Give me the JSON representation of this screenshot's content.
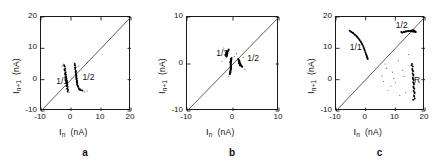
{
  "figure": {
    "caption_letters": [
      "a",
      "b",
      "c"
    ],
    "axis_unit": "(nA)",
    "x_axis_symbol": "I",
    "x_axis_sub": "n",
    "y_axis_symbol": "I",
    "y_axis_sub": "n+1"
  },
  "chart_data": [
    {
      "type": "scatter",
      "panel": "a",
      "title": "",
      "xlabel": "I_n (nA)",
      "ylabel": "I_n+1 (nA)",
      "xlim": [
        -10,
        20
      ],
      "ylim": [
        -10,
        20
      ],
      "xticks": [
        -10,
        0,
        10,
        20
      ],
      "yticks": [
        -10,
        0,
        10,
        20
      ],
      "xticklabels": [
        "-10",
        "0",
        "10",
        "20"
      ],
      "yticklabels": [
        "-10",
        "0",
        "10",
        "20"
      ],
      "grid": false,
      "legend": "none",
      "identity_line": {
        "from": [
          -10,
          -10
        ],
        "to": [
          20,
          20
        ],
        "label": "y = x"
      },
      "annotations": [
        {
          "text": "1/1",
          "x": -4.6,
          "y": -0.6
        },
        {
          "text": "1/2",
          "x": 4.2,
          "y": 0.6
        }
      ],
      "series": [
        {
          "name": "1/1",
          "marker": "dot",
          "points": [
            [
              -2.1,
              4.2
            ],
            [
              -1.9,
              3.5
            ],
            [
              -2.0,
              2.9
            ],
            [
              -1.8,
              2.4
            ],
            [
              -1.9,
              2.0
            ],
            [
              -1.7,
              1.6
            ],
            [
              -1.8,
              1.2
            ],
            [
              -1.6,
              0.9
            ],
            [
              -1.7,
              0.6
            ],
            [
              -1.5,
              0.3
            ],
            [
              -1.6,
              0.0
            ],
            [
              -1.4,
              -0.3
            ],
            [
              -1.5,
              -0.6
            ],
            [
              -1.3,
              -0.9
            ],
            [
              -1.4,
              -1.2
            ],
            [
              -1.2,
              -1.5
            ],
            [
              -1.3,
              -1.9
            ],
            [
              -1.1,
              -2.3
            ],
            [
              -1.2,
              -2.8
            ],
            [
              -1.0,
              -3.3
            ],
            [
              -2.2,
              3.2
            ],
            [
              -2.0,
              1.8
            ],
            [
              -1.9,
              0.7
            ],
            [
              -1.8,
              -0.2
            ],
            [
              -1.6,
              -1.1
            ],
            [
              -1.5,
              -2.0
            ],
            [
              -1.3,
              -2.9
            ],
            [
              -2.3,
              4.6
            ],
            [
              -1.1,
              -3.8
            ],
            [
              -1.45,
              -0.45
            ]
          ]
        },
        {
          "name": "1/2",
          "marker": "dot",
          "points": [
            [
              1.3,
              4.6
            ],
            [
              1.5,
              4.0
            ],
            [
              1.4,
              3.4
            ],
            [
              1.6,
              2.9
            ],
            [
              1.5,
              2.4
            ],
            [
              1.7,
              2.0
            ],
            [
              1.6,
              1.6
            ],
            [
              1.8,
              1.2
            ],
            [
              1.7,
              0.8
            ],
            [
              1.9,
              0.5
            ],
            [
              1.8,
              0.1
            ],
            [
              2.0,
              -0.3
            ],
            [
              1.9,
              -0.7
            ],
            [
              2.1,
              -1.1
            ],
            [
              2.0,
              -1.5
            ],
            [
              2.2,
              -1.9
            ],
            [
              2.4,
              -2.3
            ],
            [
              2.6,
              -2.7
            ],
            [
              2.9,
              -3.0
            ],
            [
              3.3,
              -3.3
            ],
            [
              1.4,
              3.8
            ],
            [
              1.6,
              2.6
            ],
            [
              1.75,
              1.4
            ],
            [
              1.85,
              0.3
            ],
            [
              2.05,
              -0.9
            ],
            [
              2.3,
              -2.1
            ],
            [
              2.8,
              -3.2
            ],
            [
              1.25,
              5.0
            ],
            [
              3.8,
              -3.5
            ],
            [
              1.95,
              -0.5
            ]
          ]
        },
        {
          "name": "scatter-noise",
          "marker": "dot",
          "points": [
            [
              1.0,
              5.4
            ],
            [
              -2.6,
              5.0
            ],
            [
              4.6,
              -3.9
            ],
            [
              -0.6,
              -4.1
            ],
            [
              5.4,
              -3.6
            ],
            [
              -3.0,
              4.4
            ],
            [
              2.6,
              4.4
            ]
          ]
        }
      ]
    },
    {
      "type": "scatter",
      "panel": "b",
      "title": "",
      "xlabel": "I_n (nA)",
      "ylabel": "I_n+1 (nA)",
      "xlim": [
        -10,
        10
      ],
      "ylim": [
        -10,
        10
      ],
      "xticks": [
        -10,
        0,
        10
      ],
      "yticks": [
        -10,
        0,
        10
      ],
      "xticklabels": [
        "-10",
        "0",
        "10"
      ],
      "yticklabels": [
        "-10",
        "0",
        "10"
      ],
      "grid": false,
      "legend": "none",
      "identity_line": {
        "from": [
          -10,
          -10
        ],
        "to": [
          10,
          10
        ],
        "label": "y = x"
      },
      "annotations": [
        {
          "text": "1/3",
          "x": -3.4,
          "y": 2.1
        },
        {
          "text": "1/2",
          "x": 3.3,
          "y": 1.0
        }
      ],
      "series": [
        {
          "name": "1/3",
          "marker": "dot",
          "points": [
            [
              -1.4,
              2.6
            ],
            [
              -1.3,
              2.4
            ],
            [
              -1.45,
              2.2
            ],
            [
              -1.35,
              2.0
            ],
            [
              -1.5,
              1.8
            ],
            [
              -1.4,
              1.6
            ],
            [
              -1.25,
              2.5
            ],
            [
              -1.55,
              2.1
            ],
            [
              -1.3,
              1.9
            ],
            [
              -1.45,
              1.7
            ],
            [
              -1.2,
              2.3
            ],
            [
              -1.5,
              2.45
            ],
            [
              -1.35,
              1.75
            ],
            [
              -1.25,
              2.05
            ],
            [
              -1.6,
              1.95
            ],
            [
              -1.1,
              2.7
            ],
            [
              -1.0,
              2.9
            ],
            [
              -0.95,
              3.1
            ]
          ]
        },
        {
          "name": "1/2-upper",
          "marker": "dot",
          "points": [
            [
              1.2,
              0.9
            ],
            [
              1.35,
              0.75
            ],
            [
              1.25,
              0.6
            ],
            [
              1.4,
              0.5
            ],
            [
              1.3,
              0.35
            ],
            [
              1.5,
              0.25
            ],
            [
              1.45,
              0.1
            ],
            [
              1.6,
              0.0
            ],
            [
              1.55,
              -0.15
            ],
            [
              1.7,
              -0.25
            ],
            [
              1.15,
              1.05
            ],
            [
              1.3,
              0.15
            ],
            [
              1.5,
              -0.3
            ],
            [
              1.62,
              -0.1
            ],
            [
              1.38,
              0.65
            ],
            [
              1.8,
              -0.4
            ],
            [
              1.9,
              -0.5
            ],
            [
              2.0,
              -0.6
            ]
          ]
        },
        {
          "name": "central-column",
          "marker": "dot",
          "points": [
            [
              -0.5,
              1.1
            ],
            [
              -0.45,
              0.8
            ],
            [
              -0.55,
              0.5
            ],
            [
              -0.4,
              0.25
            ],
            [
              -0.5,
              0.0
            ],
            [
              -0.45,
              -0.25
            ],
            [
              -0.55,
              -0.5
            ],
            [
              -0.4,
              -0.75
            ],
            [
              -0.5,
              -1.0
            ],
            [
              -0.45,
              -1.25
            ],
            [
              -0.6,
              -1.5
            ],
            [
              -0.55,
              -1.75
            ],
            [
              -0.65,
              -2.0
            ],
            [
              -0.35,
              0.95
            ],
            [
              -0.6,
              0.35
            ],
            [
              -0.42,
              -0.4
            ],
            [
              -0.52,
              -1.15
            ],
            [
              -0.62,
              -1.85
            ],
            [
              -0.3,
              1.3
            ],
            [
              -0.7,
              -2.2
            ],
            [
              -0.48,
              -0.9
            ],
            [
              -0.58,
              -1.6
            ],
            [
              -0.38,
              0.6
            ],
            [
              -0.52,
              -0.05
            ]
          ]
        },
        {
          "name": "scatter-noise",
          "marker": "dot",
          "points": [
            [
              -2.0,
              3.4
            ],
            [
              0.3,
              1.6
            ],
            [
              2.6,
              -1.2
            ],
            [
              -1.0,
              -2.6
            ],
            [
              0.8,
              2.2
            ],
            [
              -2.4,
              0.6
            ],
            [
              2.2,
              1.4
            ]
          ]
        }
      ]
    },
    {
      "type": "scatter",
      "panel": "c",
      "title": "",
      "xlabel": "I_n (nA)",
      "ylabel": "I_n+1 (nA)",
      "xlim": [
        -10,
        20
      ],
      "ylim": [
        -10,
        20
      ],
      "xticks": [
        -10,
        0,
        10,
        20
      ],
      "yticks": [
        -10,
        0,
        10,
        20
      ],
      "xticklabels": [
        "-10",
        "0",
        "10",
        "20"
      ],
      "yticklabels": [
        "-10",
        "0",
        "10",
        "20"
      ],
      "grid": false,
      "legend": "none",
      "identity_line": {
        "from": [
          -10,
          -10
        ],
        "to": [
          20,
          20
        ],
        "label": "y = x"
      },
      "annotations": [
        {
          "text": "1/1",
          "x": -5.0,
          "y": 10.2
        },
        {
          "text": "1/2",
          "x": 10.5,
          "y": 17.2
        },
        {
          "text": "R",
          "x": 16.6,
          "y": -0.4
        }
      ],
      "series": [
        {
          "name": "1/1",
          "marker": "dot",
          "points": [
            [
              -5.4,
              15.6
            ],
            [
              -4.8,
              15.2
            ],
            [
              -4.2,
              14.8
            ],
            [
              -3.6,
              14.3
            ],
            [
              -3.0,
              13.8
            ],
            [
              -2.5,
              13.2
            ],
            [
              -2.0,
              12.6
            ],
            [
              -1.5,
              11.9
            ],
            [
              -1.1,
              11.2
            ],
            [
              -0.7,
              10.4
            ],
            [
              -0.4,
              9.6
            ],
            [
              -0.1,
              8.8
            ],
            [
              0.2,
              8.0
            ],
            [
              0.4,
              7.4
            ],
            [
              0.6,
              6.9
            ],
            [
              -5.0,
              15.4
            ],
            [
              -4.4,
              15.0
            ],
            [
              -3.8,
              14.5
            ],
            [
              -3.2,
              14.0
            ],
            [
              -2.7,
              13.5
            ],
            [
              -2.2,
              12.9
            ],
            [
              -1.7,
              12.2
            ],
            [
              -1.3,
              11.5
            ],
            [
              -0.9,
              10.8
            ],
            [
              -0.55,
              10.0
            ],
            [
              -0.25,
              9.2
            ],
            [
              0.05,
              8.4
            ],
            [
              0.3,
              7.7
            ],
            [
              0.5,
              7.1
            ],
            [
              0.7,
              6.6
            ]
          ]
        },
        {
          "name": "1/2",
          "marker": "dot",
          "points": [
            [
              12.0,
              15.2
            ],
            [
              12.8,
              15.3
            ],
            [
              13.4,
              15.4
            ],
            [
              14.0,
              15.5
            ],
            [
              14.6,
              15.5
            ],
            [
              15.2,
              15.6
            ],
            [
              15.7,
              15.6
            ],
            [
              16.1,
              15.6
            ],
            [
              16.4,
              15.5
            ],
            [
              16.7,
              15.4
            ],
            [
              12.4,
              15.0
            ],
            [
              13.1,
              15.2
            ],
            [
              13.7,
              15.35
            ],
            [
              14.3,
              15.45
            ],
            [
              14.9,
              15.5
            ],
            [
              15.4,
              15.6
            ],
            [
              15.9,
              15.55
            ],
            [
              16.25,
              15.45
            ],
            [
              16.6,
              15.3
            ],
            [
              16.9,
              15.2
            ],
            [
              15.8,
              15.8
            ],
            [
              16.0,
              15.3
            ],
            [
              16.3,
              15.7
            ],
            [
              15.5,
              15.4
            ]
          ]
        },
        {
          "name": "R",
          "marker": "dot",
          "points": [
            [
              15.6,
              5.0
            ],
            [
              15.9,
              4.2
            ],
            [
              15.7,
              3.4
            ],
            [
              16.0,
              2.7
            ],
            [
              15.8,
              2.0
            ],
            [
              16.1,
              1.3
            ],
            [
              15.9,
              0.6
            ],
            [
              16.2,
              -0.1
            ],
            [
              16.0,
              -0.8
            ],
            [
              16.3,
              -1.5
            ],
            [
              16.1,
              -2.2
            ],
            [
              16.4,
              -2.9
            ],
            [
              16.2,
              -3.6
            ],
            [
              16.5,
              -4.3
            ],
            [
              16.3,
              -5.0
            ],
            [
              15.5,
              4.6
            ],
            [
              15.8,
              3.0
            ],
            [
              16.05,
              1.6
            ],
            [
              15.95,
              0.2
            ],
            [
              16.25,
              -1.2
            ],
            [
              16.15,
              -2.6
            ],
            [
              16.45,
              -4.0
            ],
            [
              16.35,
              -5.4
            ],
            [
              16.55,
              -6.0
            ],
            [
              16.0,
              -6.4
            ]
          ]
        },
        {
          "name": "scatter-noise",
          "marker": "dot",
          "points": [
            [
              7.0,
              3.6
            ],
            [
              9.0,
              2.4
            ],
            [
              6.0,
              -0.6
            ],
            [
              8.5,
              -2.0
            ],
            [
              11.0,
              6.0
            ],
            [
              10.0,
              -1.0
            ],
            [
              12.5,
              3.0
            ],
            [
              5.5,
              1.2
            ],
            [
              13.5,
              -4.0
            ],
            [
              7.5,
              -3.4
            ],
            [
              9.5,
              0.4
            ],
            [
              14.5,
              8.0
            ],
            [
              11.5,
              -5.0
            ],
            [
              6.5,
              5.0
            ],
            [
              13.0,
              1.0
            ]
          ]
        }
      ]
    }
  ]
}
